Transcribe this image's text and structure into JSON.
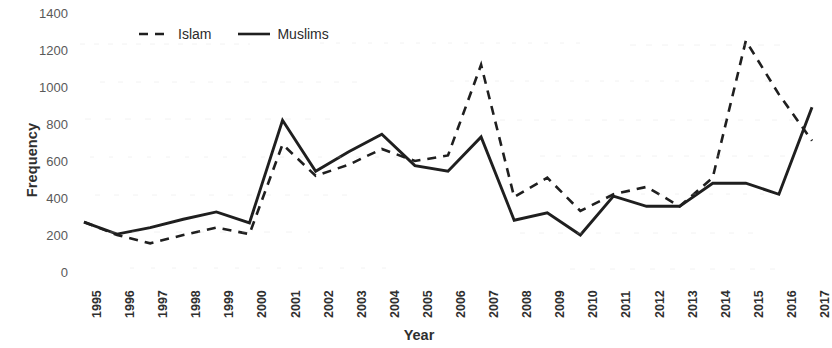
{
  "chart_data": {
    "type": "line",
    "title": "",
    "xlabel": "Year",
    "ylabel": "Frequency",
    "ylim": [
      0,
      1400
    ],
    "yticks": [
      0,
      200,
      400,
      600,
      800,
      1000,
      1200,
      1400
    ],
    "grid": false,
    "legend_position": "top-left-inside",
    "categories": [
      "1995",
      "1996",
      "1997",
      "1998",
      "1999",
      "2000",
      "2001",
      "2002",
      "2003",
      "2004",
      "2005",
      "2006",
      "2007",
      "2008",
      "2009",
      "2010",
      "2011",
      "2012",
      "2013",
      "2014",
      "2015",
      "2016",
      "2017"
    ],
    "series": [
      {
        "name": "Islam",
        "style": "dashed",
        "color": "#1f1f1f",
        "values": [
          270,
          200,
          155,
          200,
          240,
          205,
          690,
          520,
          580,
          665,
          600,
          630,
          1120,
          405,
          510,
          330,
          420,
          460,
          355,
          510,
          1250,
          960,
          710
        ]
      },
      {
        "name": "Muslims",
        "style": "solid",
        "color": "#1f1f1f",
        "values": [
          270,
          205,
          240,
          285,
          325,
          265,
          820,
          545,
          650,
          745,
          575,
          545,
          730,
          280,
          320,
          200,
          410,
          355,
          355,
          480,
          480,
          420,
          890
        ]
      }
    ]
  },
  "axes": {
    "y_title": "Frequency",
    "x_title": "Year"
  },
  "legend": {
    "items": [
      {
        "label": "Islam",
        "swatch": "dashed-line-swatch"
      },
      {
        "label": "Muslims",
        "swatch": "solid-line-swatch"
      }
    ]
  }
}
